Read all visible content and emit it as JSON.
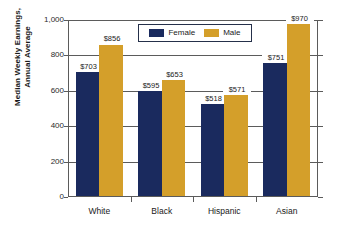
{
  "chart_data": {
    "type": "bar",
    "title": "",
    "xlabel": "",
    "ylabel_line1": "Median Weekly Earnings,",
    "ylabel_line2": "Annual Average",
    "categories": [
      "White",
      "Black",
      "Hispanic",
      "Asian"
    ],
    "series": [
      {
        "name": "Female",
        "color": "#1a2a5e",
        "values": [
          703,
          595,
          518,
          751
        ],
        "labels": [
          "$703",
          "$595",
          "$518",
          "$751"
        ]
      },
      {
        "name": "Male",
        "color": "#d49f2a",
        "values": [
          856,
          653,
          571,
          970
        ],
        "labels": [
          "$856",
          "$653",
          "$571",
          "$970"
        ]
      }
    ],
    "ylim": [
      0,
      1000
    ],
    "yticks": [
      0,
      200,
      400,
      600,
      800,
      1000
    ],
    "ytick_labels": [
      "0",
      "200",
      "400",
      "600",
      "800",
      "1,000"
    ],
    "grid": true,
    "legend_position": "top-center"
  },
  "legend": {
    "entries": [
      {
        "label": "Female"
      },
      {
        "label": "Male"
      }
    ]
  },
  "axis": {
    "y_title_line1": "Median Weekly Earnings,",
    "y_title_line2": "Annual Average",
    "ytick_labels": [
      "1,000",
      "800",
      "600",
      "400",
      "200",
      "0"
    ],
    "xtick_labels": [
      "White",
      "Black",
      "Hispanic",
      "Asian"
    ]
  }
}
